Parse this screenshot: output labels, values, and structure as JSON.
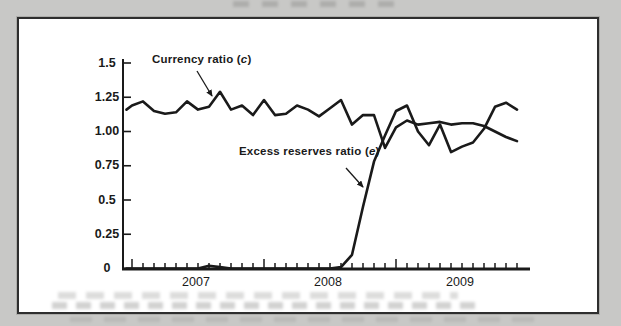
{
  "page": {
    "background_color": "#c8c8c6",
    "panel_background": "#ffffff",
    "panel_border_color": "#2e2e2e",
    "line_color": "#1a1a1a",
    "text_color": "#1a1a1a"
  },
  "chart_data": {
    "type": "line",
    "title": "",
    "grid": false,
    "legend_position": "in-plot annotations with arrows",
    "y_axis": {
      "range": [
        0,
        1.5
      ],
      "tick_labels": [
        "1.5",
        "1.25",
        "1.00",
        "0.75",
        "0.5",
        "0.25",
        "0"
      ],
      "tick_values": [
        1.5,
        1.25,
        1.0,
        0.75,
        0.5,
        0.25,
        0
      ]
    },
    "x_axis": {
      "unit": "month",
      "tick_interval": "monthly",
      "start": "2006-12",
      "end": "2009-12",
      "year_labels": [
        "2007",
        "2008",
        "2009"
      ]
    },
    "months": [
      "2006-12",
      "2007-01",
      "2007-02",
      "2007-03",
      "2007-04",
      "2007-05",
      "2007-06",
      "2007-07",
      "2007-08",
      "2007-09",
      "2007-10",
      "2007-11",
      "2007-12",
      "2008-01",
      "2008-02",
      "2008-03",
      "2008-04",
      "2008-05",
      "2008-06",
      "2008-07",
      "2008-08",
      "2008-09",
      "2008-10",
      "2008-11",
      "2008-12",
      "2009-01",
      "2009-02",
      "2009-03",
      "2009-04",
      "2009-05",
      "2009-06",
      "2009-07",
      "2009-08",
      "2009-09",
      "2009-10",
      "2009-11",
      "2009-12"
    ],
    "series": [
      {
        "name": "Currency ratio (c)",
        "values": [
          1.16,
          1.19,
          1.22,
          1.15,
          1.13,
          1.14,
          1.22,
          1.16,
          1.18,
          1.29,
          1.16,
          1.19,
          1.12,
          1.23,
          1.12,
          1.13,
          1.19,
          1.16,
          1.11,
          1.17,
          1.23,
          1.05,
          1.12,
          1.12,
          0.88,
          1.03,
          1.08,
          1.05,
          1.06,
          1.07,
          1.05,
          1.06,
          1.06,
          1.04,
          1.0,
          0.96,
          0.93
        ]
      },
      {
        "name": "Excess reserves ratio (e)",
        "values": [
          0.0,
          0.0,
          0.0,
          0.0,
          0.0,
          0.0,
          0.0,
          0.0,
          0.02,
          0.01,
          0.0,
          0.0,
          0.0,
          0.0,
          0.0,
          0.0,
          0.0,
          0.0,
          0.0,
          0.0,
          0.01,
          0.1,
          0.45,
          0.78,
          0.97,
          1.15,
          1.19,
          1.0,
          0.9,
          1.05,
          0.85,
          0.89,
          0.92,
          1.02,
          1.18,
          1.21,
          1.16
        ]
      }
    ],
    "annotations": [
      {
        "prefix": "Currency ratio (",
        "variable": "c",
        "suffix": ")"
      },
      {
        "prefix": "Excess reserves ratio (",
        "variable": "e",
        "suffix": ")"
      }
    ]
  }
}
